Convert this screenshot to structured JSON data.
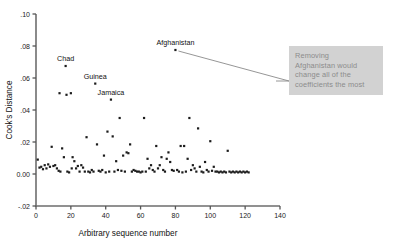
{
  "chart_data": {
    "type": "scatter",
    "title": "",
    "xlabel": "Arbitrary sequence number",
    "ylabel": "Cook's Distance",
    "xlim": [
      0,
      140
    ],
    "ylim": [
      -0.02,
      0.1
    ],
    "xticks": [
      0,
      20,
      40,
      60,
      80,
      100,
      120,
      140
    ],
    "xtick_labels": [
      "0",
      "20",
      "40",
      "60",
      "80",
      "100",
      "120",
      "140"
    ],
    "yticks": [
      -0.02,
      0.0,
      0.02,
      0.04,
      0.06,
      0.08,
      0.1
    ],
    "ytick_labels": [
      "-.02",
      "0.00",
      ".02",
      ".04",
      ".06",
      ".08",
      ".10"
    ],
    "grid": false,
    "legend": null,
    "marker": "square",
    "marker_color": "#1b1b1b",
    "points": [
      {
        "x": 1,
        "y": 0.009
      },
      {
        "x": 2,
        "y": 0.004
      },
      {
        "x": 3,
        "y": 0.0045
      },
      {
        "x": 4,
        "y": 0.003
      },
      {
        "x": 5,
        "y": 0.0055
      },
      {
        "x": 6,
        "y": 0.0035
      },
      {
        "x": 7,
        "y": 0.006
      },
      {
        "x": 8,
        "y": 0.0045
      },
      {
        "x": 9,
        "y": 0.017
      },
      {
        "x": 10,
        "y": 0.005
      },
      {
        "x": 11,
        "y": 0.0055
      },
      {
        "x": 12,
        "y": 0.0035
      },
      {
        "x": 13,
        "y": 0.002
      },
      {
        "x": 13.5,
        "y": 0.0505
      },
      {
        "x": 14,
        "y": 0.0015
      },
      {
        "x": 15,
        "y": 0.016
      },
      {
        "x": 16,
        "y": 0.0105
      },
      {
        "x": 17,
        "y": 0.0675
      },
      {
        "x": 17.5,
        "y": 0.0495
      },
      {
        "x": 18,
        "y": 0.0015
      },
      {
        "x": 19,
        "y": 0.001
      },
      {
        "x": 20,
        "y": 0.0505
      },
      {
        "x": 20.5,
        "y": 0.0035
      },
      {
        "x": 21,
        "y": 0.0105
      },
      {
        "x": 22,
        "y": 0.008
      },
      {
        "x": 23,
        "y": 0.0035
      },
      {
        "x": 24,
        "y": 0.005
      },
      {
        "x": 25,
        "y": 0.0015
      },
      {
        "x": 26,
        "y": 0.0055
      },
      {
        "x": 27,
        "y": 0.004
      },
      {
        "x": 28,
        "y": 0.0015
      },
      {
        "x": 29,
        "y": 0.023
      },
      {
        "x": 30,
        "y": 0.0015
      },
      {
        "x": 31,
        "y": 0.001
      },
      {
        "x": 32,
        "y": 0.0025
      },
      {
        "x": 33,
        "y": 0.0015
      },
      {
        "x": 34,
        "y": 0.0565
      },
      {
        "x": 35,
        "y": 0.0185
      },
      {
        "x": 36,
        "y": 0.002
      },
      {
        "x": 37,
        "y": 0.0015
      },
      {
        "x": 38,
        "y": 0.0025
      },
      {
        "x": 39,
        "y": 0.0115
      },
      {
        "x": 40,
        "y": 0.001
      },
      {
        "x": 41,
        "y": 0.0265
      },
      {
        "x": 42,
        "y": 0.0015
      },
      {
        "x": 43,
        "y": 0.0465
      },
      {
        "x": 44,
        "y": 0.0235
      },
      {
        "x": 45,
        "y": 0.0015
      },
      {
        "x": 46,
        "y": 0.008
      },
      {
        "x": 47,
        "y": 0.0025
      },
      {
        "x": 48,
        "y": 0.035
      },
      {
        "x": 49,
        "y": 0.002
      },
      {
        "x": 50,
        "y": 0.0115
      },
      {
        "x": 51,
        "y": 0.0015
      },
      {
        "x": 52,
        "y": 0.0135
      },
      {
        "x": 53,
        "y": 0.013
      },
      {
        "x": 54,
        "y": 0.0185
      },
      {
        "x": 55,
        "y": 0.0015
      },
      {
        "x": 56,
        "y": 0.0025
      },
      {
        "x": 57,
        "y": 0.002
      },
      {
        "x": 58,
        "y": 0.0015
      },
      {
        "x": 59,
        "y": 0.0015
      },
      {
        "x": 60,
        "y": 0.001
      },
      {
        "x": 61,
        "y": 0.0015
      },
      {
        "x": 62,
        "y": 0.035
      },
      {
        "x": 63,
        "y": 0.0015
      },
      {
        "x": 64,
        "y": 0.0095
      },
      {
        "x": 65,
        "y": 0.0035
      },
      {
        "x": 66,
        "y": 0.0055
      },
      {
        "x": 67,
        "y": 0.0025
      },
      {
        "x": 68,
        "y": 0.0015
      },
      {
        "x": 69,
        "y": 0.0175
      },
      {
        "x": 70,
        "y": 0.0035
      },
      {
        "x": 71,
        "y": 0.0055
      },
      {
        "x": 72,
        "y": 0.0105
      },
      {
        "x": 73,
        "y": 0.0025
      },
      {
        "x": 74,
        "y": 0.0015
      },
      {
        "x": 75,
        "y": 0.0095
      },
      {
        "x": 76,
        "y": 0.0135
      },
      {
        "x": 77,
        "y": 0.0075
      },
      {
        "x": 78,
        "y": 0.0025
      },
      {
        "x": 79,
        "y": 0.002
      },
      {
        "x": 80,
        "y": 0.0775
      },
      {
        "x": 81,
        "y": 0.0025
      },
      {
        "x": 82,
        "y": 0.0015
      },
      {
        "x": 83,
        "y": 0.0175
      },
      {
        "x": 84,
        "y": 0.001
      },
      {
        "x": 85,
        "y": 0.0175
      },
      {
        "x": 86,
        "y": 0.0015
      },
      {
        "x": 87,
        "y": 0.0095
      },
      {
        "x": 88,
        "y": 0.035
      },
      {
        "x": 89,
        "y": 0.0025
      },
      {
        "x": 90,
        "y": 0.0055
      },
      {
        "x": 91,
        "y": 0.0035
      },
      {
        "x": 92,
        "y": 0.0015
      },
      {
        "x": 93,
        "y": 0.0285
      },
      {
        "x": 94,
        "y": 0.0045
      },
      {
        "x": 95,
        "y": 0.0015
      },
      {
        "x": 96,
        "y": 0.001
      },
      {
        "x": 97,
        "y": 0.0075
      },
      {
        "x": 98,
        "y": 0.0025
      },
      {
        "x": 99,
        "y": 0.0015
      },
      {
        "x": 100,
        "y": 0.0205
      },
      {
        "x": 101,
        "y": 0.002
      },
      {
        "x": 102,
        "y": 0.0045
      },
      {
        "x": 103,
        "y": 0.0015
      },
      {
        "x": 104,
        "y": 0.0015
      },
      {
        "x": 105,
        "y": 0.001
      },
      {
        "x": 106,
        "y": 0.0015
      },
      {
        "x": 107,
        "y": 0.001
      },
      {
        "x": 108,
        "y": 0.0015
      },
      {
        "x": 109,
        "y": 0.001
      },
      {
        "x": 110,
        "y": 0.0145
      },
      {
        "x": 111,
        "y": 0.0015
      },
      {
        "x": 112,
        "y": 0.001
      },
      {
        "x": 113,
        "y": 0.0015
      },
      {
        "x": 114,
        "y": 0.001
      },
      {
        "x": 115,
        "y": 0.0015
      },
      {
        "x": 116,
        "y": 0.001
      },
      {
        "x": 117,
        "y": 0.0015
      },
      {
        "x": 118,
        "y": 0.001
      },
      {
        "x": 119,
        "y": 0.0015
      },
      {
        "x": 120,
        "y": 0.001
      },
      {
        "x": 121,
        "y": 0.0015
      },
      {
        "x": 122,
        "y": 0.001
      }
    ],
    "annotations": [
      {
        "label": "Chad",
        "x": 17,
        "y": 0.0675
      },
      {
        "label": "Guinea",
        "x": 34,
        "y": 0.0565
      },
      {
        "label": "Jamaica",
        "x": 43,
        "y": 0.0465
      },
      {
        "label": "Afghanistan",
        "x": 80,
        "y": 0.0775
      }
    ]
  },
  "callout": {
    "text": "Removing\nAfghanistan would\nchange all of the\ncoefficients the most",
    "background_color": "#d2d2d2",
    "text_color": "#8c8c8c"
  }
}
